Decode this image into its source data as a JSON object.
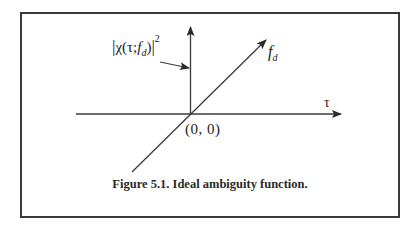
{
  "figure": {
    "caption": "Figure 5.1. Ideal ambiguity function.",
    "labels": {
      "ambiguity_prefix": "χ(τ;",
      "ambiguity_f": "f",
      "ambiguity_sub": "d",
      "ambiguity_close": ")",
      "ambiguity_exponent": "2",
      "abs_bar": "|",
      "doppler_axis": "f",
      "doppler_axis_sub": "d",
      "delay_axis": "τ",
      "origin": "(0, 0)"
    },
    "elements": {
      "vertical_axis": "ambiguity magnitude axis with upward arrow",
      "horizontal_axis": "delay axis τ with rightward arrow",
      "diagonal_axis": "Doppler axis f_d with arrow",
      "pointer_arrow": "arrow from |χ(τ;f_d)|² label to vertical axis (impulse at origin)"
    },
    "colors": {
      "line": "#3a3a3a",
      "text": "#222222",
      "background": "#ffffff"
    }
  }
}
